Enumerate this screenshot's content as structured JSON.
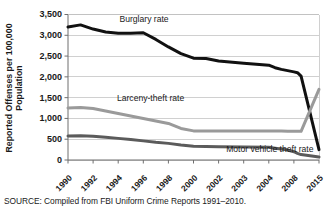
{
  "chart_data": {
    "type": "line",
    "title": "",
    "xlabel": "",
    "ylabel": "Reported Offenses per 100,000",
    "ylabel_line2": "Population",
    "ylim": [
      0,
      3500
    ],
    "ytick_values": [
      0,
      500,
      1000,
      1500,
      2000,
      2500,
      3000,
      3500
    ],
    "ytick_labels": [
      "0",
      "500",
      "1,000",
      "1,500",
      "2,000",
      "2,500",
      "3,000",
      "3,500"
    ],
    "grid": true,
    "legend_position": "inline-annotations",
    "categories": [
      "1990",
      "1992",
      "1994",
      "1996",
      "1998",
      "2000",
      "2002",
      "2003",
      "2004",
      "2008",
      "2015"
    ],
    "series": [
      {
        "name": "Burglary rate",
        "color": "#111111",
        "width": 3.0,
        "label_x_index": 2.05,
        "label_y": 3330,
        "values": [
          3200,
          3100,
          3050,
          3050,
          2700,
          2450,
          2350,
          2300,
          2200,
          2100,
          250
        ],
        "dense_x": [
          1990,
          1991,
          1992,
          1993,
          1994,
          1995,
          1996,
          1997,
          1998,
          1999,
          2000,
          2001,
          2002,
          2003,
          2004,
          2005,
          2006,
          2007,
          2008,
          2009,
          2010,
          2015
        ],
        "dense_y": [
          3200,
          3250,
          3150,
          3080,
          3050,
          3050,
          3060,
          2900,
          2720,
          2560,
          2450,
          2440,
          2380,
          2330,
          2280,
          2220,
          2180,
          2150,
          2120,
          2100,
          2020,
          250
        ]
      },
      {
        "name": "Larceny-theft rate",
        "color": "#9a9a9a",
        "width": 3.0,
        "label_x_index": 1.95,
        "label_y": 1410,
        "values": [
          1250,
          1260,
          1150,
          1050,
          940,
          700,
          700,
          700,
          700,
          690,
          1700
        ],
        "dense_x": [
          1990,
          1991,
          1992,
          1993,
          1994,
          1995,
          1996,
          1997,
          1998,
          1999,
          2000,
          2001,
          2002,
          2003,
          2004,
          2005,
          2006,
          2007,
          2008,
          2009,
          2010,
          2015
        ],
        "dense_y": [
          1250,
          1265,
          1240,
          1180,
          1120,
          1060,
          1000,
          940,
          880,
          760,
          700,
          700,
          700,
          700,
          700,
          700,
          695,
          690,
          690,
          690,
          690,
          1700
        ]
      },
      {
        "name": "Motor vehicle theft rate",
        "color": "#5b5b5b",
        "width": 3.0,
        "label_x_index": 6.3,
        "label_y": 195,
        "values": [
          580,
          580,
          540,
          500,
          440,
          330,
          320,
          310,
          300,
          190,
          70
        ],
        "dense_x": [
          1990,
          1991,
          1992,
          1993,
          1994,
          1995,
          1996,
          1997,
          1998,
          1999,
          2000,
          2001,
          2002,
          2003,
          2004,
          2005,
          2006,
          2007,
          2008,
          2009,
          2010,
          2015
        ],
        "dense_y": [
          580,
          585,
          570,
          545,
          520,
          495,
          460,
          425,
          400,
          360,
          330,
          325,
          320,
          315,
          305,
          285,
          265,
          240,
          200,
          160,
          130,
          70
        ]
      }
    ]
  },
  "source": {
    "text": "SOURCE: Compiled from FBI Uniform Crime Reports 1991–2010."
  }
}
